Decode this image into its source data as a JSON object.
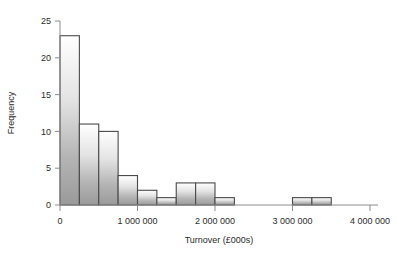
{
  "chart_data": {
    "type": "bar",
    "title": "",
    "subtitle": "",
    "xlabel": "Turnover (£000s)",
    "ylabel": "Frequency",
    "xlim": [
      0,
      4000000
    ],
    "ylim": [
      0,
      25
    ],
    "bin_width": 250000,
    "grid": false,
    "legend": null,
    "xticks": [
      0,
      1000000,
      2000000,
      3000000,
      4000000
    ],
    "xtick_labels": [
      "0",
      "1 000 000",
      "2 000 000",
      "3 000 000",
      "4 000 000"
    ],
    "yticks": [
      0,
      5,
      10,
      15,
      20,
      25
    ],
    "ytick_labels": [
      "0",
      "5",
      "10",
      "15",
      "20",
      "25"
    ],
    "bin_edges": [
      0,
      250000,
      500000,
      750000,
      1000000,
      1250000,
      1500000,
      1750000,
      2000000,
      2250000,
      2500000,
      2750000,
      3000000,
      3250000,
      3500000,
      3750000,
      4000000
    ],
    "categories": [
      "0–250 000",
      "250 000–500 000",
      "500 000–750 000",
      "750 000–1 000 000",
      "1 000 000–1 250 000",
      "1 250 000–1 500 000",
      "1 500 000–1 750 000",
      "1 750 000–2 000 000",
      "2 000 000–2 250 000",
      "2 250 000–2 500 000",
      "2 500 000–2 750 000",
      "2 750 000–3 000 000",
      "3 000 000–3 250 000",
      "3 250 000–3 500 000",
      "3 500 000–3 750 000",
      "3 750 000–4 000 000"
    ],
    "values": [
      23,
      11,
      10,
      4,
      2,
      1,
      3,
      3,
      1,
      0,
      0,
      0,
      1,
      1,
      0,
      0
    ],
    "colors": {
      "bar_top": "#ffffff",
      "bar_bottom": "#9a9a9a",
      "bar_outline": "#4a4a4a",
      "axis": "#8c8c8c",
      "text": "#2b2b2b",
      "background": "#ffffff"
    }
  }
}
